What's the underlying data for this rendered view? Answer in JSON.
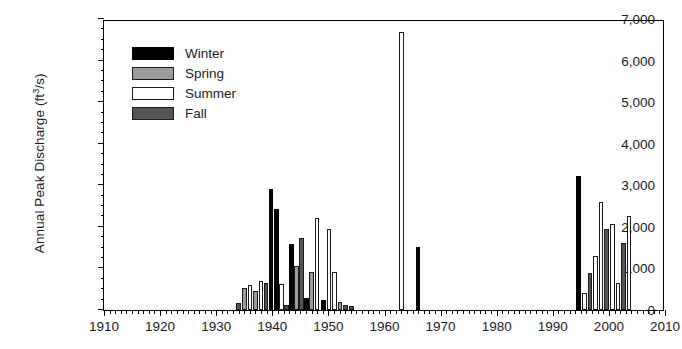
{
  "chart_data": {
    "type": "bar",
    "title": "",
    "xlabel": "",
    "ylabel": "Annual Peak Discharge (ft3/s)",
    "ylabel_main": "Annual Peak Discharge (ft",
    "ylabel_sup": "3",
    "ylabel_tail": "/s)",
    "xlim": [
      1910,
      2010
    ],
    "ylim": [
      0,
      7000
    ],
    "ytick_step": 1000,
    "ytick_minor_step": 250,
    "xtick_step": 10,
    "xtick_minor_step": 1,
    "grid": false,
    "legend_position": "upper-left",
    "ytick_labels": [
      "0",
      "1,000",
      "2,000",
      "3,000",
      "4,000",
      "5,000",
      "6,000",
      "7,000"
    ],
    "ytick_values": [
      0,
      1000,
      2000,
      3000,
      4000,
      5000,
      6000,
      7000
    ],
    "xtick_labels": [
      "1910",
      "1920",
      "1930",
      "1940",
      "1950",
      "1960",
      "1970",
      "1980",
      "1990",
      "2000",
      "2010"
    ],
    "xtick_values": [
      1910,
      1920,
      1930,
      1940,
      1950,
      1960,
      1970,
      1980,
      1990,
      2000,
      2010
    ],
    "legend": [
      {
        "name": "Winter",
        "color": "#000000"
      },
      {
        "name": "Spring",
        "color": "#9d9d9d"
      },
      {
        "name": "Summer",
        "color": "#ffffff"
      },
      {
        "name": "Fall",
        "color": "#555555"
      }
    ],
    "series_key": "season",
    "bars": [
      {
        "year": 1934,
        "value": 170,
        "season": "Fall"
      },
      {
        "year": 1935,
        "value": 530,
        "season": "Spring"
      },
      {
        "year": 1936,
        "value": 610,
        "season": "Summer"
      },
      {
        "year": 1937,
        "value": 450,
        "season": "Spring"
      },
      {
        "year": 1938,
        "value": 700,
        "season": "Summer"
      },
      {
        "year": 1938.9,
        "value": 660,
        "season": "Fall"
      },
      {
        "year": 1939.8,
        "value": 2910,
        "season": "Winter"
      },
      {
        "year": 1940.7,
        "value": 2420,
        "season": "Winter"
      },
      {
        "year": 1941.6,
        "value": 620,
        "season": "Summer"
      },
      {
        "year": 1942.5,
        "value": 120,
        "season": "Fall"
      },
      {
        "year": 1943.4,
        "value": 1580,
        "season": "Winter"
      },
      {
        "year": 1944.3,
        "value": 1060,
        "season": "Spring"
      },
      {
        "year": 1945.2,
        "value": 1730,
        "season": "Fall"
      },
      {
        "year": 1946.1,
        "value": 300,
        "season": "Winter"
      },
      {
        "year": 1947,
        "value": 920,
        "season": "Spring"
      },
      {
        "year": 1948,
        "value": 2220,
        "season": "Summer"
      },
      {
        "year": 1949.1,
        "value": 230,
        "season": "Winter"
      },
      {
        "year": 1950.1,
        "value": 1950,
        "season": "Summer"
      },
      {
        "year": 1951.1,
        "value": 920,
        "season": "Summer"
      },
      {
        "year": 1952.1,
        "value": 190,
        "season": "Spring"
      },
      {
        "year": 1953.1,
        "value": 115,
        "season": "Fall"
      },
      {
        "year": 1954.1,
        "value": 100,
        "season": "Fall"
      },
      {
        "year": 1963,
        "value": 6680,
        "season": "Summer"
      },
      {
        "year": 1966,
        "value": 1520,
        "season": "Winter"
      },
      {
        "year": 1994.6,
        "value": 3230,
        "season": "Winter"
      },
      {
        "year": 1995.6,
        "value": 420,
        "season": "Summer"
      },
      {
        "year": 1996.6,
        "value": 880,
        "season": "Fall"
      },
      {
        "year": 1997.6,
        "value": 1300,
        "season": "Summer"
      },
      {
        "year": 1998.6,
        "value": 2600,
        "season": "Summer"
      },
      {
        "year": 1999.6,
        "value": 1960,
        "season": "Fall"
      },
      {
        "year": 2000.6,
        "value": 2080,
        "season": "Summer"
      },
      {
        "year": 2001.6,
        "value": 650,
        "season": "Summer"
      },
      {
        "year": 2002.6,
        "value": 1620,
        "season": "Fall"
      },
      {
        "year": 2003.6,
        "value": 2270,
        "season": "Summer"
      }
    ]
  }
}
